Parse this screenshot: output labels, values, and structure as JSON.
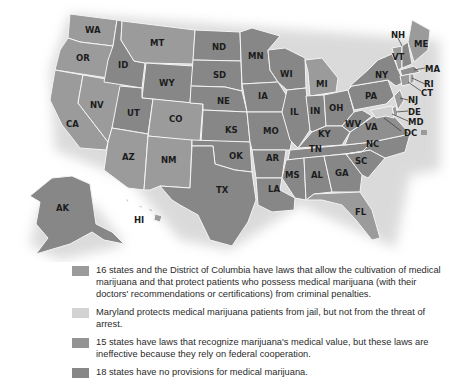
{
  "colors": {
    "legal": "#9b9b9b",
    "maryland": "#cfcfcf",
    "ineffective": "#8f8f8f",
    "none": "#878787",
    "border": "#f4f4f4",
    "shadow": "#d9d9d9"
  },
  "legend": [
    {
      "category": "legal",
      "text": "16 states and the District of Columbia have laws that allow the cultivation of medical marijuana and that protect patients who possess medical marijuana (with their doctors' recommendations or certifications) from criminal penalties."
    },
    {
      "category": "maryland",
      "text": "Maryland protects medical marijuana patients from jail, but not from the threat of arrest."
    },
    {
      "category": "ineffective",
      "text": "15 states  have laws that recognize marijuana's medical value, but these laws are ineffective because they rely on federal cooperation."
    },
    {
      "category": "none",
      "text": "18 states have no provisions for medical marijuana."
    }
  ],
  "states": {
    "WA": "WA",
    "OR": "OR",
    "CA": "CA",
    "NV": "NV",
    "ID": "ID",
    "MT": "MT",
    "WY": "WY",
    "UT": "UT",
    "CO": "CO",
    "AZ": "AZ",
    "NM": "NM",
    "ND": "ND",
    "SD": "SD",
    "NE": "NE",
    "KS": "KS",
    "OK": "OK",
    "TX": "TX",
    "MN": "MN",
    "IA": "IA",
    "MO": "MO",
    "AR": "AR",
    "LA": "LA",
    "WI": "WI",
    "IL": "IL",
    "MI": "MI",
    "IN": "IN",
    "OH": "OH",
    "KY": "KY",
    "TN": "TN",
    "MS": "MS",
    "AL": "AL",
    "GA": "GA",
    "FL": "FL",
    "SC": "SC",
    "NC": "NC",
    "VA": "VA",
    "WV": "WV",
    "PA": "PA",
    "NY": "NY",
    "VT": "VT",
    "NH": "NH",
    "ME": "ME",
    "MA": "MA",
    "RI": "RI",
    "CT": "CT",
    "NJ": "NJ",
    "DE": "DE",
    "MD": "MD",
    "DC": "DC",
    "AK": "AK",
    "HI": "HI"
  }
}
